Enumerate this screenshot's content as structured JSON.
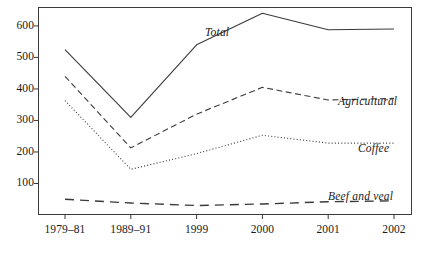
{
  "chart_data": {
    "type": "line",
    "title": "",
    "subtitle": "",
    "xlabel": "",
    "ylabel": "",
    "categories": [
      "1979–81",
      "1989–91",
      "1999",
      "2000",
      "2001",
      "2002"
    ],
    "ylim": [
      0,
      660
    ],
    "yticks": [
      100,
      200,
      300,
      400,
      500,
      600
    ],
    "ytick_labels": [
      "100",
      "200",
      "300",
      "400",
      "500",
      "600"
    ],
    "grid": false,
    "legend_position": "inline-right",
    "series": [
      {
        "name": "Total",
        "style": "solid",
        "color": "#3a3a3a",
        "values": [
          525,
          310,
          540,
          640,
          588,
          590
        ]
      },
      {
        "name": "Agricultural",
        "style": "dashed",
        "color": "#3a3a3a",
        "values": [
          440,
          213,
          320,
          405,
          365,
          370
        ]
      },
      {
        "name": "Coffee",
        "style": "dotted",
        "color": "#3a3a3a",
        "values": [
          363,
          145,
          195,
          253,
          228,
          228
        ]
      },
      {
        "name": "Beef and veal",
        "style": "long-dashed",
        "color": "#3a3a3a",
        "values": [
          50,
          38,
          30,
          35,
          42,
          45
        ]
      }
    ],
    "annotations": [
      {
        "text": "Total",
        "x_px": 205,
        "y_px": 27
      },
      {
        "text": "Agricultural",
        "x_px": 338,
        "y_px": 96
      },
      {
        "text": "Coffee",
        "x_px": 358,
        "y_px": 143
      },
      {
        "text": "Beef and veal",
        "x_px": 328,
        "y_px": 191
      }
    ]
  },
  "axis": {
    "frame_color": "#3a3a3a",
    "tick_color": "#3a3a3a",
    "text_color": "#1a1a1a"
  }
}
